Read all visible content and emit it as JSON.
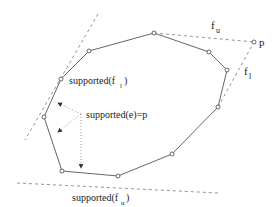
{
  "diagram": {
    "colors": {
      "polygon": "#555555",
      "dashed": "#777777",
      "dotted": "#888888",
      "text": "#222222"
    },
    "vertices": [
      [
        89,
        51
      ],
      [
        154,
        33
      ],
      [
        209,
        52
      ],
      [
        227,
        70
      ],
      [
        218,
        107
      ],
      [
        172,
        154
      ],
      [
        118,
        176
      ],
      [
        62,
        171
      ],
      [
        44,
        117
      ],
      [
        61,
        79
      ]
    ],
    "point_p": [
      254,
      42
    ],
    "labels": {
      "p": "p",
      "f_u_top": "f",
      "f_u_top_sub": "u",
      "f_l_right": "f",
      "f_l_right_sub": "l",
      "supported_f_l": "supported(f",
      "supported_f_l_sub": "l",
      "supported_f_l_close": ")",
      "supported_e": "supported(e)=p",
      "supported_f_u": "supported(f",
      "supported_f_u_sub": "u",
      "supported_f_u_close": ")"
    }
  }
}
